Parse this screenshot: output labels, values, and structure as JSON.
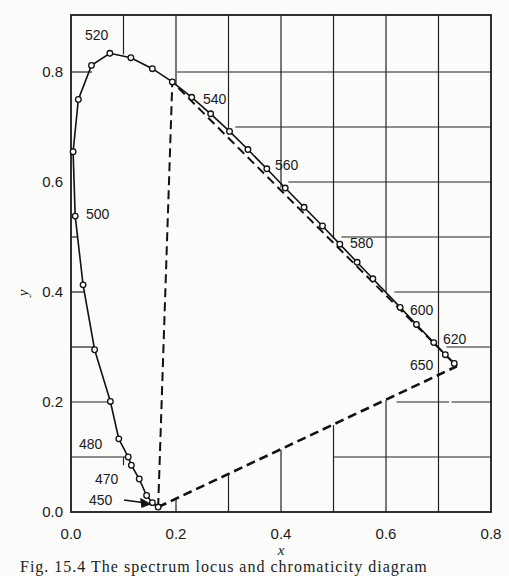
{
  "chart_data": {
    "type": "line",
    "title": "",
    "xlabel": "x",
    "ylabel": "y",
    "xlim": [
      0.0,
      0.8
    ],
    "ylim": [
      0.0,
      0.9
    ],
    "grid": true,
    "x_ticks": [
      "0.0",
      "0.2",
      "0.4",
      "0.6",
      "0.8"
    ],
    "y_ticks": [
      "0.0",
      "0.2",
      "0.4",
      "0.6",
      "0.8"
    ],
    "series": [
      {
        "name": "spectrum locus",
        "style": "solid with circle markers",
        "points": [
          [
            0.166,
            0.009
          ],
          [
            0.155,
            0.017
          ],
          [
            0.144,
            0.03
          ],
          [
            0.13,
            0.06
          ],
          [
            0.115,
            0.085
          ],
          [
            0.109,
            0.1
          ],
          [
            0.091,
            0.133
          ],
          [
            0.075,
            0.201
          ],
          [
            0.045,
            0.295
          ],
          [
            0.023,
            0.413
          ],
          [
            0.008,
            0.538
          ],
          [
            0.004,
            0.655
          ],
          [
            0.014,
            0.75
          ],
          [
            0.039,
            0.812
          ],
          [
            0.074,
            0.834
          ],
          [
            0.114,
            0.826
          ],
          [
            0.155,
            0.806
          ],
          [
            0.193,
            0.782
          ],
          [
            0.23,
            0.754
          ],
          [
            0.266,
            0.724
          ],
          [
            0.302,
            0.692
          ],
          [
            0.337,
            0.659
          ],
          [
            0.373,
            0.624
          ],
          [
            0.408,
            0.589
          ],
          [
            0.444,
            0.554
          ],
          [
            0.479,
            0.52
          ],
          [
            0.512,
            0.487
          ],
          [
            0.545,
            0.454
          ],
          [
            0.575,
            0.424
          ],
          [
            0.627,
            0.372
          ],
          [
            0.658,
            0.341
          ],
          [
            0.691,
            0.308
          ],
          [
            0.713,
            0.286
          ],
          [
            0.73,
            0.27
          ]
        ]
      },
      {
        "name": "purple line",
        "style": "dashed",
        "points": [
          [
            0.166,
            0.009
          ],
          [
            0.735,
            0.265
          ]
        ]
      },
      {
        "name": "primary triangle",
        "style": "dashed",
        "points": [
          [
            0.166,
            0.009
          ],
          [
            0.193,
            0.782
          ],
          [
            0.735,
            0.265
          ]
        ]
      }
    ],
    "annotations": [
      {
        "text": "450",
        "x": 0.166,
        "y": 0.009,
        "arrow": true
      },
      {
        "text": "470",
        "x": 0.13,
        "y": 0.06
      },
      {
        "text": "480",
        "x": 0.091,
        "y": 0.133
      },
      {
        "text": "500",
        "x": 0.008,
        "y": 0.538
      },
      {
        "text": "520",
        "x": 0.074,
        "y": 0.834
      },
      {
        "text": "540",
        "x": 0.23,
        "y": 0.754
      },
      {
        "text": "560",
        "x": 0.373,
        "y": 0.624
      },
      {
        "text": "580",
        "x": 0.512,
        "y": 0.487
      },
      {
        "text": "600",
        "x": 0.627,
        "y": 0.372
      },
      {
        "text": "620",
        "x": 0.691,
        "y": 0.308
      },
      {
        "text": "650",
        "x": 0.73,
        "y": 0.27
      }
    ]
  },
  "axes": {
    "xlabel": "x",
    "ylabel": "y",
    "x_ticks": [
      "0.0",
      "0.2",
      "0.4",
      "0.6",
      "0.8"
    ],
    "y_ticks": [
      "0.0",
      "0.2",
      "0.4",
      "0.6",
      "0.8"
    ]
  },
  "labels": {
    "w450": "450",
    "w470": "470",
    "w480": "480",
    "w500": "500",
    "w520": "520",
    "w540": "540",
    "w560": "560",
    "w580": "580",
    "w600": "600",
    "w620": "620",
    "w650": "650"
  },
  "caption": "Fig. 15.4   The spectrum locus and chromaticity diagram"
}
